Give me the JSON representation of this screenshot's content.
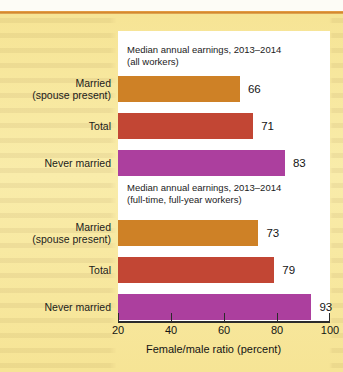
{
  "chart_data": {
    "type": "bar",
    "orientation": "horizontal",
    "title": "",
    "xlabel": "Female/male ratio (percent)",
    "ylabel": "",
    "xlim": [
      20,
      100
    ],
    "xticks": [
      20,
      40,
      60,
      80,
      100
    ],
    "grid": false,
    "legend": false,
    "categories": [
      "Married\n(spouse present)",
      "Total",
      "Never married"
    ],
    "panels": [
      {
        "title": "Median annual earnings, 2013–2014\n(all workers)",
        "categories": [
          "Married\n(spouse present)",
          "Total",
          "Never married"
        ],
        "values": [
          66,
          71,
          83
        ],
        "colors": [
          "#ce8126",
          "#c24634",
          "#ac3f9e"
        ]
      },
      {
        "title": "Median annual earnings, 2013–2014\n(full-time, full-year workers)",
        "categories": [
          "Married\n(spouse present)",
          "Total",
          "Never married"
        ],
        "values": [
          73,
          79,
          93
        ],
        "colors": [
          "#ce8126",
          "#c24634",
          "#ac3f9e"
        ]
      }
    ],
    "tick_labels": [
      "20",
      "40",
      "60",
      "80",
      "100"
    ]
  },
  "panel_all": {
    "title": "Median annual earnings, 2013–2014\n(all workers)",
    "bars": [
      {
        "label": "Married\n(spouse present)",
        "value": 66,
        "value_text": "66",
        "color": "#ce8126"
      },
      {
        "label": "Total",
        "value": 71,
        "value_text": "71",
        "color": "#c24634"
      },
      {
        "label": "Never married",
        "value": 83,
        "value_text": "83",
        "color": "#ac3f9e"
      }
    ]
  },
  "panel_fulltime": {
    "title": "Median annual earnings, 2013–2014\n(full-time, full-year workers)",
    "bars": [
      {
        "label": "Married\n(spouse present)",
        "value": 73,
        "value_text": "73",
        "color": "#ce8126"
      },
      {
        "label": "Total",
        "value": 79,
        "value_text": "79",
        "color": "#c24634"
      },
      {
        "label": "Never married",
        "value": 93,
        "value_text": "93",
        "color": "#ac3f9e"
      }
    ]
  },
  "axis": {
    "xlabel": "Female/male ratio (percent)",
    "ticks": [
      {
        "value": 20,
        "text": "20"
      },
      {
        "value": 40,
        "text": "40"
      },
      {
        "value": 60,
        "text": "60"
      },
      {
        "value": 80,
        "text": "80"
      },
      {
        "value": 100,
        "text": "100"
      }
    ]
  },
  "colors": {
    "orange": "#ce8126",
    "red": "#c24634",
    "purple": "#ac3f9e",
    "page_background": "#f7e79b",
    "panel_background": "#ffffff",
    "rule": "#d1842b",
    "text": "#1b1b1b"
  }
}
